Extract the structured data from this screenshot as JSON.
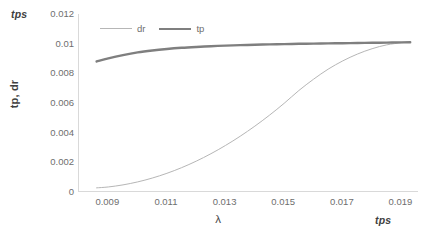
{
  "chart_data": {
    "type": "line",
    "title": "",
    "xlabel": "λ",
    "ylabel": "tp, dr",
    "x_unit_label": "tps",
    "y_unit_label": "tps",
    "xlim": [
      0.008,
      0.0196
    ],
    "ylim": [
      0,
      0.012
    ],
    "grid": false,
    "legend_position": "top-left-inside",
    "xticks": [
      "0.009",
      "0.011",
      "0.013",
      "0.015",
      "0.017",
      "0.019"
    ],
    "xtick_values": [
      0.009,
      0.011,
      0.013,
      0.015,
      0.017,
      0.019
    ],
    "yticks": [
      "0",
      "0.002",
      "0.004",
      "0.006",
      "0.008",
      "0.01",
      "0.012"
    ],
    "ytick_values": [
      0,
      0.002,
      0.004,
      0.006,
      0.008,
      0.01,
      0.012
    ],
    "series": [
      {
        "name": "dr",
        "color": "#b6b6b6",
        "width": 1,
        "x": [
          0.0086,
          0.009,
          0.0095,
          0.01,
          0.0105,
          0.011,
          0.0115,
          0.012,
          0.0125,
          0.013,
          0.0135,
          0.014,
          0.0145,
          0.015,
          0.0155,
          0.016,
          0.0165,
          0.017,
          0.0175,
          0.018,
          0.0185,
          0.019,
          0.0193
        ],
        "values": [
          0.00028,
          0.00034,
          0.00048,
          0.00068,
          0.00094,
          0.00126,
          0.00164,
          0.00208,
          0.00258,
          0.00314,
          0.00376,
          0.00444,
          0.00518,
          0.00598,
          0.00684,
          0.0076,
          0.00828,
          0.00884,
          0.0093,
          0.00966,
          0.00992,
          0.01006,
          0.0101
        ]
      },
      {
        "name": "tp",
        "color": "#7f7f7f",
        "width": 2.4,
        "x": [
          0.0086,
          0.009,
          0.0095,
          0.01,
          0.0105,
          0.011,
          0.0115,
          0.012,
          0.0125,
          0.013,
          0.0135,
          0.014,
          0.0145,
          0.015,
          0.0155,
          0.016,
          0.0165,
          0.017,
          0.0175,
          0.018,
          0.0185,
          0.019,
          0.0193
        ],
        "values": [
          0.0088,
          0.00901,
          0.00923,
          0.00941,
          0.00954,
          0.00964,
          0.00972,
          0.00978,
          0.00983,
          0.00987,
          0.0099,
          0.00993,
          0.00995,
          0.00997,
          0.00999,
          0.01,
          0.01002,
          0.01003,
          0.01004,
          0.01006,
          0.01007,
          0.01009,
          0.0101
        ]
      }
    ]
  },
  "legend": {
    "items": [
      {
        "label": "dr"
      },
      {
        "label": "tp"
      }
    ]
  },
  "colors": {
    "dr": "#b6b6b6",
    "tp": "#7f7f7f",
    "axis": "#d9d9d9",
    "tick_text": "#6e6e6e",
    "title_text": "#3f3f3f",
    "background": "#ffffff"
  }
}
